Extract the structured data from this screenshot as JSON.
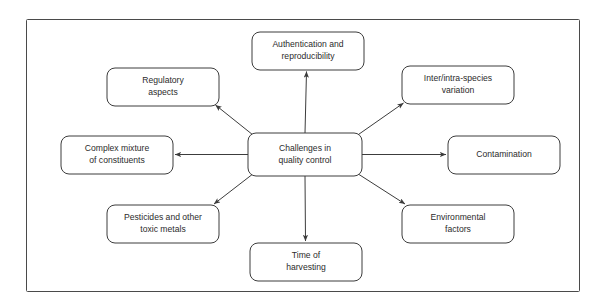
{
  "diagram": {
    "frame": {
      "border_color": "#4a4a4a",
      "background_color": "#ffffff"
    },
    "center_node": {
      "id": "center",
      "label_line1": "Challenges in",
      "label_line2": "quality control",
      "x": 305,
      "y": 154.5,
      "w": 114,
      "h": 43
    },
    "node_style": {
      "stroke_color": "#3c3c3c",
      "fill_color": "#ffffff",
      "text_color": "#2b2b2b",
      "corner_radius": 8
    },
    "connector_style": {
      "stroke_color": "#3c3c3c",
      "arrow_direction": "outward-from-center"
    },
    "nodes": [
      {
        "id": "authentication",
        "label_line1": "Authentication and",
        "label_line2": "reproducibility",
        "x": 308,
        "y": 51,
        "w": 112,
        "h": 38,
        "anchor": "bottom"
      },
      {
        "id": "regulatory",
        "label_line1": "Regulatory",
        "label_line2": "aspects",
        "x": 163,
        "y": 87,
        "w": 112,
        "h": 38,
        "anchor": "bottom-right"
      },
      {
        "id": "inter-intra-species",
        "label_line1": "Inter/intra-species",
        "label_line2": "variation",
        "x": 458,
        "y": 85,
        "w": 112,
        "h": 38,
        "anchor": "bottom-left"
      },
      {
        "id": "complex-mixture",
        "label_line1": "Complex mixture",
        "label_line2": "of constituents",
        "x": 117,
        "y": 155,
        "w": 112,
        "h": 38,
        "anchor": "right"
      },
      {
        "id": "contamination",
        "label_line1": "Contamination",
        "label_line2": "",
        "x": 504,
        "y": 155,
        "w": 112,
        "h": 38,
        "anchor": "left"
      },
      {
        "id": "pesticides",
        "label_line1": "Pesticides and other",
        "label_line2": "toxic metals",
        "x": 163,
        "y": 224,
        "w": 112,
        "h": 38,
        "anchor": "top-right"
      },
      {
        "id": "environmental",
        "label_line1": "Environmental",
        "label_line2": "factors",
        "x": 458,
        "y": 224,
        "w": 112,
        "h": 38,
        "anchor": "top-left"
      },
      {
        "id": "time-of-harvesting",
        "label_line1": "Time of",
        "label_line2": "harvesting",
        "x": 306,
        "y": 262,
        "w": 112,
        "h": 38,
        "anchor": "top"
      }
    ],
    "connectors": [
      {
        "id": "center-to-authentication",
        "x1": 305,
        "y1": 133,
        "x2": 306.5,
        "y2": 71.5
      },
      {
        "id": "center-to-regulatory",
        "x1": 258,
        "y1": 139,
        "x2": 215.5,
        "y2": 105
      },
      {
        "id": "center-to-inter-intra-species",
        "x1": 352,
        "y1": 139,
        "x2": 403.5,
        "y2": 103
      },
      {
        "id": "center-to-complex-mixture",
        "x1": 248,
        "y1": 154.5,
        "x2": 175,
        "y2": 154.5
      },
      {
        "id": "center-to-contamination",
        "x1": 362,
        "y1": 154.5,
        "x2": 446,
        "y2": 154.5
      },
      {
        "id": "center-to-pesticides",
        "x1": 258,
        "y1": 170,
        "x2": 214,
        "y2": 204
      },
      {
        "id": "center-to-environmental",
        "x1": 352,
        "y1": 170,
        "x2": 405,
        "y2": 204
      },
      {
        "id": "center-to-time-of-harvesting",
        "x1": 305,
        "y1": 176,
        "x2": 305.5,
        "y2": 241
      }
    ]
  }
}
